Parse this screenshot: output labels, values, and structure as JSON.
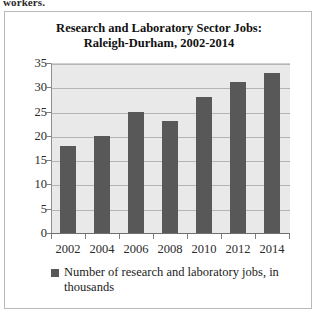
{
  "page": {
    "running_text": "workers."
  },
  "figure": {
    "title_line1": "Research and Laboratory Sector Jobs:",
    "title_line2": "Raleigh-Durham, 2002-2014",
    "border_color": "#b9b9b9"
  },
  "legend": {
    "position": "bottom",
    "swatch_color": "#585858",
    "label": "Number of research and laboratory jobs, in thousands"
  },
  "chart_data": {
    "type": "bar",
    "title": "Research and Laboratory Sector Jobs: Raleigh-Durham, 2002-2014",
    "xlabel": "",
    "ylabel": "",
    "categories": [
      "2002",
      "2004",
      "2006",
      "2008",
      "2010",
      "2012",
      "2014"
    ],
    "values": [
      18,
      20,
      25,
      23,
      28,
      31,
      33
    ],
    "series": [
      {
        "name": "Number of research and laboratory jobs, in thousands",
        "values": [
          18,
          20,
          25,
          23,
          28,
          31,
          33
        ],
        "color": "#585858"
      }
    ],
    "ylim": [
      0,
      35
    ],
    "ytick_step": 5,
    "yticks": [
      "35",
      "30",
      "25",
      "20",
      "15",
      "10",
      "5",
      "0"
    ],
    "ytick_values": [
      35,
      30,
      25,
      20,
      15,
      10,
      5,
      0
    ],
    "grid": true,
    "grid_axis": "y",
    "plot_background": "#e9e9e9",
    "gridline_color": "#b5b5b5",
    "legend_position": "bottom"
  }
}
